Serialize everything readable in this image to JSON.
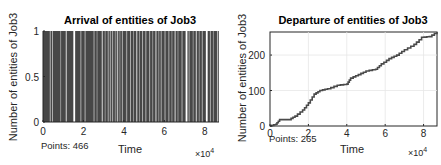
{
  "chart_data": [
    {
      "type": "bar",
      "title": "Arrival of entities of Job3",
      "xlabel": "Time",
      "ylabel": "Number of entities of Job3",
      "x_multiplier": "×10^4",
      "xlim": [
        0,
        8.7
      ],
      "ylim": [
        0,
        1
      ],
      "xticks": [
        "0",
        "2",
        "4",
        "6",
        "8"
      ],
      "yticks": [
        "0",
        "0.5",
        "1"
      ],
      "grid": true,
      "annotation": "Points: 466",
      "description": "Dense stem/bar plot of unit arrivals (value 1) across time; light gaps indicate intervals without arrivals",
      "gap_positions_x1e4": [
        0.33,
        0.45,
        0.85,
        1.12,
        1.5,
        1.85,
        2.05,
        2.5,
        2.65,
        2.9,
        3.05,
        3.2,
        3.3,
        3.42,
        3.55,
        3.65,
        3.78,
        3.9,
        4.1,
        4.3,
        4.45,
        4.6,
        4.75,
        4.9,
        5.05,
        5.25,
        5.4,
        5.55,
        5.7,
        5.82,
        6.0,
        6.2,
        6.35,
        6.5,
        6.65,
        6.85,
        7.05,
        7.2,
        7.4,
        7.55,
        7.7,
        7.85,
        8.05,
        8.25,
        8.4,
        8.6
      ]
    },
    {
      "type": "line",
      "title": "Departure of entities of Job3",
      "xlabel": "Time",
      "ylabel": "Number of entities of Job3",
      "x_multiplier": "×10^4",
      "xlim": [
        0,
        8.7
      ],
      "ylim": [
        0,
        265
      ],
      "xticks": [
        "0",
        "2",
        "4",
        "6",
        "8"
      ],
      "yticks": [
        "0",
        "100",
        "200"
      ],
      "grid": true,
      "annotation": "Points: 265",
      "x": [
        0,
        0.3,
        0.5,
        1.0,
        1.3,
        1.7,
        2.0,
        2.3,
        2.6,
        3.0,
        3.5,
        4.0,
        4.2,
        4.6,
        5.0,
        5.5,
        5.8,
        6.2,
        6.6,
        7.0,
        7.5,
        7.9,
        8.3,
        8.7
      ],
      "y": [
        0,
        5,
        18,
        18,
        28,
        45,
        65,
        90,
        100,
        105,
        115,
        118,
        135,
        145,
        155,
        160,
        175,
        190,
        200,
        215,
        230,
        250,
        252,
        265
      ]
    }
  ],
  "left": {
    "title": "Arrival of entities of Job3",
    "xlabel": "Time",
    "ylabel": "Number of entities of Job3",
    "points": "Points: 466",
    "mult_base": "×10",
    "mult_exp": "4",
    "xticks": [
      "0",
      "2",
      "4",
      "6",
      "8"
    ],
    "yticks": [
      "0",
      "0.5",
      "1"
    ]
  },
  "right": {
    "title": "Departure of entities of Job3",
    "xlabel": "Time",
    "ylabel": "Number of entities of Job3",
    "points": "Points: 265",
    "mult_base": "×10",
    "mult_exp": "4",
    "xticks": [
      "0",
      "2",
      "4",
      "6",
      "8"
    ],
    "yticks": [
      "0",
      "100",
      "200"
    ]
  },
  "colors": {
    "bar_fill": "#474747",
    "line": "#4a4a4a",
    "axis": "#262626",
    "grid": "#e6e6e6"
  }
}
